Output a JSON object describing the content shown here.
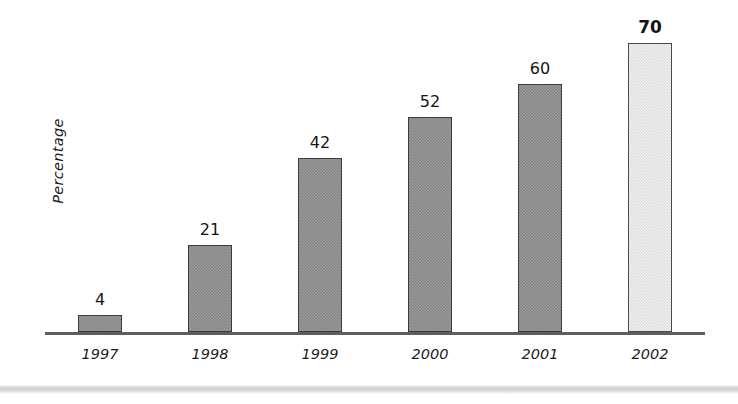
{
  "chart_data": {
    "type": "bar",
    "title": "",
    "subtitle": "",
    "xlabel": "",
    "ylabel": "Percentage",
    "categories": [
      "1997",
      "1998",
      "1999",
      "2000",
      "2001",
      "2002"
    ],
    "values": [
      4,
      21,
      42,
      52,
      60,
      70
    ],
    "value_labels": [
      "4",
      "21",
      "42",
      "52",
      "60",
      "70"
    ],
    "ylim": [
      0,
      76
    ],
    "grid": false,
    "legend": null,
    "axis_ticks_visible": false,
    "series": [
      {
        "name": "Percentage",
        "values": [
          4,
          21,
          42,
          52,
          60,
          70
        ]
      }
    ],
    "bar_styles": [
      {
        "category": "1997",
        "fill": "#8a8a8a",
        "border": "#3c3c3c",
        "highlight": false,
        "label_bold": false
      },
      {
        "category": "1998",
        "fill": "#8a8a8a",
        "border": "#3c3c3c",
        "highlight": false,
        "label_bold": false
      },
      {
        "category": "1999",
        "fill": "#8a8a8a",
        "border": "#3c3c3c",
        "highlight": false,
        "label_bold": false
      },
      {
        "category": "2000",
        "fill": "#8a8a8a",
        "border": "#3c3c3c",
        "highlight": false,
        "label_bold": false
      },
      {
        "category": "2001",
        "fill": "#8a8a8a",
        "border": "#3c3c3c",
        "highlight": false,
        "label_bold": false
      },
      {
        "category": "2002",
        "fill": "#e3e3e3",
        "border": "#4a4a4a",
        "highlight": true,
        "label_bold": true
      }
    ],
    "colors": {
      "background": "#ffffff",
      "bar_default": "#8a8a8a",
      "bar_highlight": "#e3e3e3",
      "bar_border": "#3c3c3c",
      "axis_line": "#5e5e5e",
      "text": "#141414"
    }
  }
}
